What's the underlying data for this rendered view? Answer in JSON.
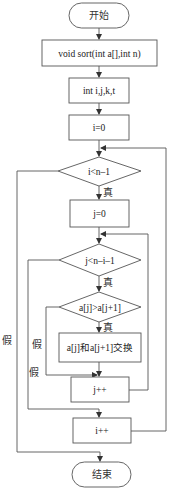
{
  "diagram": {
    "type": "flowchart",
    "nodes": {
      "start": {
        "label": "开始",
        "shape": "terminal"
      },
      "func": {
        "label": "void sort(int a[],int n)",
        "shape": "process"
      },
      "decl": {
        "label": "int i,j,k,t",
        "shape": "process"
      },
      "init_i": {
        "label": "i=0",
        "shape": "process"
      },
      "cond_i": {
        "label": "i<n–1",
        "shape": "decision"
      },
      "init_j": {
        "label": "j=0",
        "shape": "process"
      },
      "cond_j": {
        "label": "j<n–i–1",
        "shape": "decision"
      },
      "cond_cmp": {
        "label": "a[j]>a[j+1]",
        "shape": "decision"
      },
      "swap": {
        "label": "a[j]和a[j+1]交换",
        "shape": "process"
      },
      "inc_j": {
        "label": "j++",
        "shape": "process"
      },
      "inc_i": {
        "label": "i++",
        "shape": "process"
      },
      "end": {
        "label": "结束",
        "shape": "terminal"
      }
    },
    "edge_labels": {
      "true_i": "真",
      "true_j": "真",
      "true_cmp": "真",
      "false_i": "假",
      "false_j": "假",
      "false_cmp": "假"
    },
    "edges": [
      {
        "from": "start",
        "to": "func"
      },
      {
        "from": "func",
        "to": "decl"
      },
      {
        "from": "decl",
        "to": "init_i"
      },
      {
        "from": "init_i",
        "to": "cond_i"
      },
      {
        "from": "cond_i",
        "to": "init_j",
        "label": "真"
      },
      {
        "from": "cond_i",
        "to": "end",
        "label": "假"
      },
      {
        "from": "init_j",
        "to": "cond_j"
      },
      {
        "from": "cond_j",
        "to": "cond_cmp",
        "label": "真"
      },
      {
        "from": "cond_j",
        "to": "inc_i",
        "label": "假"
      },
      {
        "from": "cond_cmp",
        "to": "swap",
        "label": "真"
      },
      {
        "from": "cond_cmp",
        "to": "inc_j",
        "label": "假"
      },
      {
        "from": "swap",
        "to": "inc_j"
      },
      {
        "from": "inc_j",
        "to": "cond_j"
      },
      {
        "from": "inc_i",
        "to": "cond_i"
      }
    ]
  }
}
